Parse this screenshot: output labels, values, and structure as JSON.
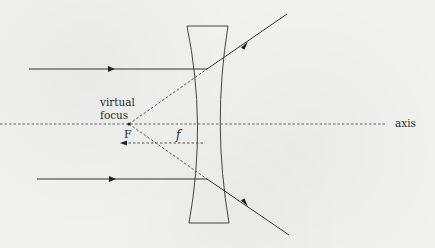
{
  "diagram": {
    "type": "diverging-lens-ray-diagram",
    "labels": {
      "virtual_line1": "virtual",
      "virtual_line2": "focus",
      "focal_point": "F",
      "focal_length": "f",
      "axis": "axis"
    },
    "colors": {
      "background": "#f1f1f0",
      "ink": "#3a3a3a"
    },
    "elements": {
      "lens": "concave (diverging) lens",
      "incident_rays": 2,
      "refracted_rays": 2,
      "virtual_ray_extensions": 2
    }
  }
}
